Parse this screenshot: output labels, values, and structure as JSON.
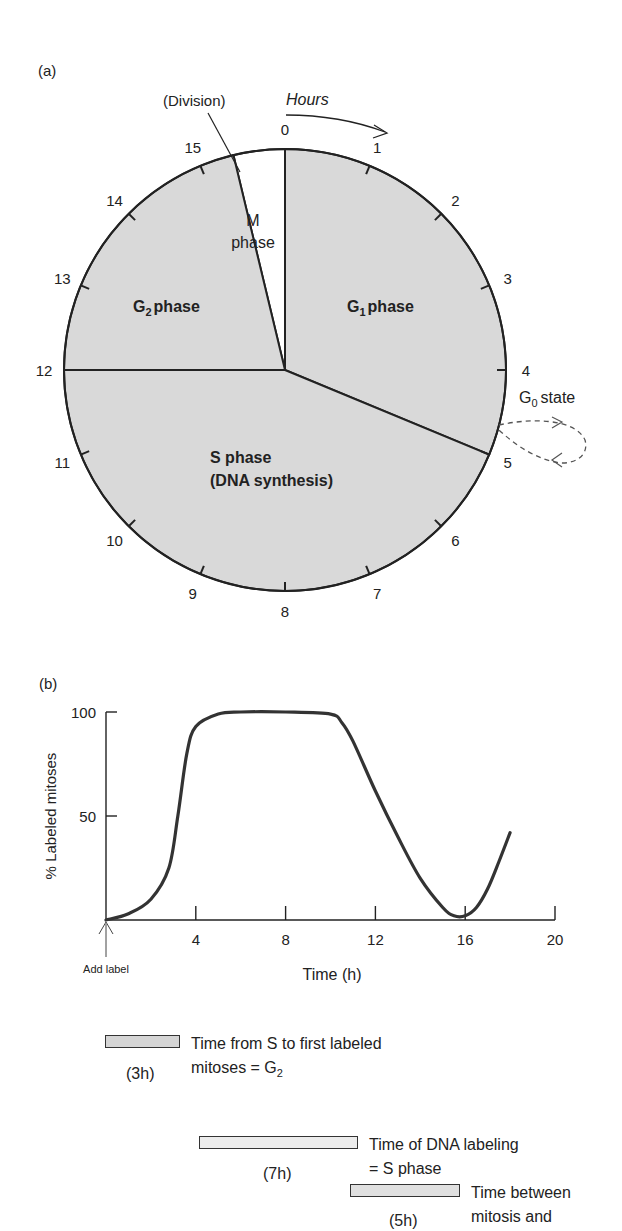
{
  "panel_a": {
    "label": "(a)",
    "division_label": "(Division)",
    "hours_label": "Hours",
    "clock_ticks": [
      "0",
      "1",
      "2",
      "3",
      "4",
      "5",
      "6",
      "7",
      "8",
      "9",
      "10",
      "11",
      "12",
      "13",
      "14",
      "15"
    ],
    "phases": [
      {
        "name": "M phase",
        "line1": "M",
        "line2": "phase",
        "start_h": 15.4,
        "end_h": 16,
        "fill": "#ffffff"
      },
      {
        "name": "G1 phase",
        "base": "G",
        "sub": "1",
        "rest": "phase",
        "start_h": 0,
        "end_h": 5,
        "fill": "#d9d9d9"
      },
      {
        "name": "S phase",
        "line1": "S phase",
        "line2": "(DNA synthesis)",
        "start_h": 5,
        "end_h": 12,
        "fill": "#d9d9d9"
      },
      {
        "name": "G2 phase",
        "base": "G",
        "sub": "2",
        "rest": "phase",
        "start_h": 12,
        "end_h": 15.4,
        "fill": "#d9d9d9"
      }
    ],
    "g0": {
      "base": "G",
      "sub": "0",
      "rest": "state"
    }
  },
  "panel_b": {
    "label": "(b)",
    "add_label": "Add label",
    "legend": [
      {
        "duration": "(3h)",
        "line1": "Time from S to first labeled",
        "line2_base": "mitoses = G",
        "line2_sub": "2"
      },
      {
        "duration": "(7h)",
        "line1": "Time of DNA labeling",
        "line2_base": "= S phase",
        "line2_sub": ""
      },
      {
        "duration": "(5h)",
        "line1": "Time between",
        "line2_base": "mitosis and",
        "line2_sub": ""
      }
    ]
  },
  "chart_data": {
    "type": "line",
    "title": "",
    "xlabel": "Time (h)",
    "ylabel": "% Labeled mitoses",
    "xlim": [
      0,
      20
    ],
    "ylim": [
      0,
      100
    ],
    "x_ticks": [
      "4",
      "8",
      "12",
      "16",
      "20"
    ],
    "y_ticks": [
      "50",
      "100"
    ],
    "grid": false,
    "series": [
      {
        "name": "% Labeled mitoses",
        "x": [
          0,
          1,
          2,
          2.8,
          3.2,
          3.6,
          4,
          5,
          6,
          8,
          10,
          10.5,
          11,
          12,
          13,
          14,
          15,
          15.5,
          16,
          16.5,
          17,
          17.5,
          18
        ],
        "y": [
          0,
          3,
          10,
          25,
          50,
          80,
          93,
          99,
          100,
          100,
          99,
          95,
          86,
          62,
          40,
          20,
          6,
          2,
          2,
          6,
          15,
          28,
          42
        ]
      }
    ]
  }
}
